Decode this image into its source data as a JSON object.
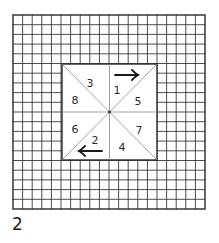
{
  "figure": {
    "caption": "2",
    "grid": {
      "columns": 20,
      "rows": 20,
      "left": 13,
      "top": 15,
      "right": 205,
      "bottom": 209,
      "line_color": "#3a3a3a",
      "border_color": "#2a2a2a"
    },
    "inner_square": {
      "cell_start": 5,
      "cell_end": 15,
      "left": 62,
      "top": 64,
      "right": 157,
      "bottom": 160,
      "fill": "#ffffff",
      "divider_color": "#8a8a8a"
    },
    "center": {
      "x": 109.5,
      "y": 112
    },
    "regions": [
      {
        "label": "3",
        "x": 90,
        "y": 84
      },
      {
        "label": "8",
        "x": 75,
        "y": 101
      },
      {
        "label": "1",
        "x": 117,
        "y": 91
      },
      {
        "label": "5",
        "x": 138,
        "y": 102
      },
      {
        "label": "6",
        "x": 75,
        "y": 130
      },
      {
        "label": "2",
        "x": 95,
        "y": 141
      },
      {
        "label": "7",
        "x": 139,
        "y": 131
      },
      {
        "label": "4",
        "x": 122,
        "y": 148
      }
    ],
    "arrows": [
      {
        "direction": "right",
        "x1": 115,
        "x2": 138,
        "y": 75
      },
      {
        "direction": "left",
        "x1": 102,
        "x2": 79,
        "y": 151
      }
    ]
  }
}
